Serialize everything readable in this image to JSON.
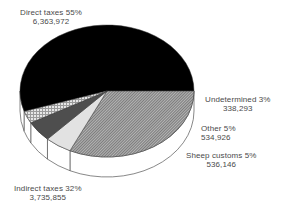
{
  "chart_data": {
    "type": "pie",
    "style": "3d",
    "title": "",
    "slices": [
      {
        "name": "Direct taxes",
        "percent": 55,
        "value": 6363972,
        "label": "Direct taxes 55%",
        "value_label": "6,363,972",
        "fill": "#000000",
        "pattern": "solid-black"
      },
      {
        "name": "Indirect taxes",
        "percent": 32,
        "value": 3735855,
        "label": "Indirect taxes 32%",
        "value_label": "3,735,855",
        "fill": "#9a9a9a",
        "pattern": "diagonal-hatch"
      },
      {
        "name": "Sheep customs",
        "percent": 5,
        "value": 536146,
        "label": "Sheep customs 5%",
        "value_label": "536,146",
        "fill": "#e4e4e4",
        "pattern": "light-grey"
      },
      {
        "name": "Other",
        "percent": 5,
        "value": 534926,
        "label": "Other 5%",
        "value_label": "534,926",
        "fill": "#555555",
        "pattern": "dark-grey"
      },
      {
        "name": "Undetermined",
        "percent": 3,
        "value": 338293,
        "label": "Undetermined 3%",
        "value_label": "338,293",
        "fill": "#c8c8c8",
        "pattern": "crosshatch"
      }
    ],
    "legend": "none (direct labels)",
    "start_angle_deg": 162,
    "direction": "clockwise"
  },
  "labels": {
    "direct": {
      "title": "Direct taxes 55%",
      "value": "6,363,972"
    },
    "undetermined": {
      "title": "Undetermined 3%",
      "value": "338,293"
    },
    "other": {
      "title": "Other 5%",
      "value": "534,926"
    },
    "sheep": {
      "title": "Sheep customs 5%",
      "value": "536,146"
    },
    "indirect": {
      "title": "Indirect taxes 32%",
      "value": "3,735,855"
    }
  }
}
